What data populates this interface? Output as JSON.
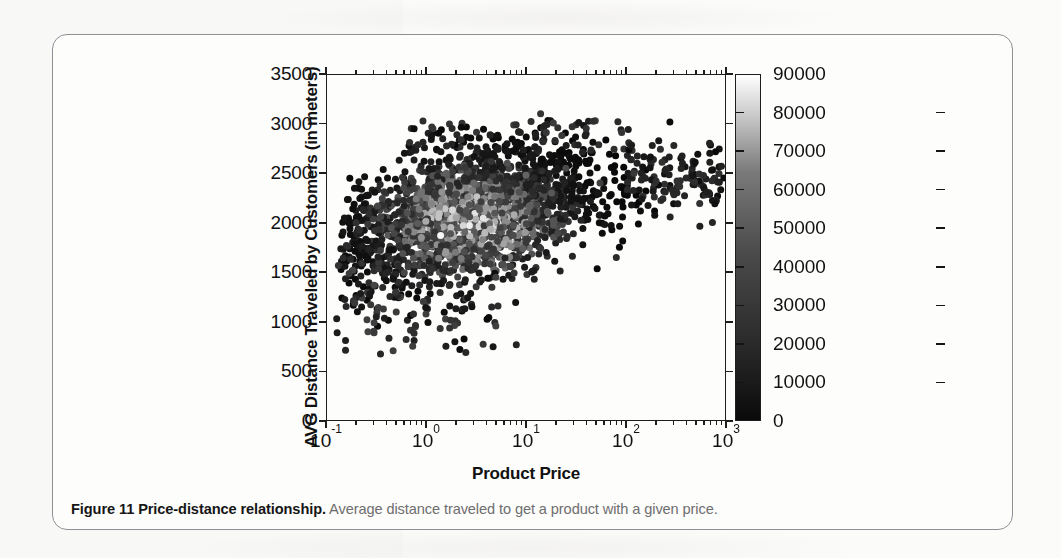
{
  "figure": {
    "caption_bold": "Figure 11  Price-distance relationship.",
    "caption_rest": " Average distance traveled to get a product with a given price."
  },
  "chart_data": {
    "type": "scatter",
    "title": "",
    "xlabel": "Product Price",
    "ylabel": "AVG Distance Traveled by Customers (in meters)",
    "xscale": "log",
    "yscale": "linear",
    "xlim": [
      0.1,
      1000
    ],
    "ylim": [
      0,
      3500
    ],
    "grid": false,
    "x_tick_labels": [
      "10-1",
      "100",
      "101",
      "102",
      "103"
    ],
    "x_tick_bases": [
      "10",
      "10",
      "10",
      "10",
      "10"
    ],
    "x_tick_exponents": [
      "-1",
      "0",
      "1",
      "2",
      "3"
    ],
    "x_tick_values": [
      0.1,
      1,
      10,
      100,
      1000
    ],
    "y_tick_labels": [
      "0",
      "500",
      "1000",
      "1500",
      "2000",
      "2500",
      "3000",
      "3500"
    ],
    "y_tick_values": [
      0,
      500,
      1000,
      1500,
      2000,
      2500,
      3000,
      3500
    ],
    "colorbar": {
      "label": "",
      "colormap": "grayscale",
      "low_color": "#0a0a0a",
      "high_color": "#ffffff",
      "vmin": 0,
      "vmax": 90000,
      "tick_labels": [
        "0",
        "10000",
        "20000",
        "30000",
        "40000",
        "50000",
        "60000",
        "70000",
        "80000",
        "90000"
      ],
      "tick_values": [
        0,
        10000,
        20000,
        30000,
        40000,
        50000,
        60000,
        70000,
        80000,
        90000
      ],
      "position": "right",
      "orientation": "vertical"
    },
    "series": [
      {
        "name": "products",
        "marker": "circle",
        "marker_size": 7,
        "n_points": 2000,
        "description": "Dense cloud rising from ~(0.4, 1800) to ~(100, 2500) then a thin tail out to ~(900, 2500); colored by number of customers (0-90000), most points dark (low counts), core of cloud mid-gray, a few near-white high-count points near (1.5, 1850).",
        "cluster_center_x": 3,
        "cluster_center_y": 2150,
        "trend": "increasing-saturating",
        "sample_points": [
          {
            "x": 0.16,
            "y": 1770,
            "c": 9000
          },
          {
            "x": 0.2,
            "y": 2000,
            "c": 11000
          },
          {
            "x": 0.35,
            "y": 1720,
            "c": 14000
          },
          {
            "x": 0.45,
            "y": 1950,
            "c": 22000
          },
          {
            "x": 0.5,
            "y": 1300,
            "c": 12000
          },
          {
            "x": 0.6,
            "y": 2350,
            "c": 18000
          },
          {
            "x": 0.75,
            "y": 1080,
            "c": 10000
          },
          {
            "x": 0.9,
            "y": 1850,
            "c": 46000
          },
          {
            "x": 1.0,
            "y": 2250,
            "c": 35000
          },
          {
            "x": 1.4,
            "y": 1870,
            "c": 86000
          },
          {
            "x": 1.6,
            "y": 2500,
            "c": 26000
          },
          {
            "x": 2.0,
            "y": 2050,
            "c": 52000
          },
          {
            "x": 2.5,
            "y": 690,
            "c": 8000
          },
          {
            "x": 3.0,
            "y": 2400,
            "c": 30000
          },
          {
            "x": 4.0,
            "y": 2150,
            "c": 48000
          },
          {
            "x": 5.0,
            "y": 1450,
            "c": 16000
          },
          {
            "x": 6.5,
            "y": 2600,
            "c": 21000
          },
          {
            "x": 8.0,
            "y": 770,
            "c": 7000
          },
          {
            "x": 10.0,
            "y": 2480,
            "c": 28000
          },
          {
            "x": 14.0,
            "y": 3100,
            "c": 12000
          },
          {
            "x": 18.0,
            "y": 2300,
            "c": 24000
          },
          {
            "x": 25.0,
            "y": 2550,
            "c": 19000
          },
          {
            "x": 40.0,
            "y": 2950,
            "c": 11000
          },
          {
            "x": 55.0,
            "y": 2400,
            "c": 15000
          },
          {
            "x": 80.0,
            "y": 1650,
            "c": 9000
          },
          {
            "x": 120.0,
            "y": 2500,
            "c": 13000
          },
          {
            "x": 200.0,
            "y": 2420,
            "c": 10000
          },
          {
            "x": 400.0,
            "y": 2450,
            "c": 8000
          },
          {
            "x": 900.0,
            "y": 2570,
            "c": 6000
          }
        ]
      }
    ]
  }
}
